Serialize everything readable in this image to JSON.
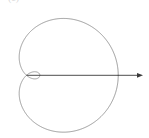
{
  "figure": {
    "panel_label": "(c)",
    "background_color": "#ffffff",
    "curve_color": "#8f8f8f",
    "axis_color": "#3a3a3a",
    "curve_stroke_width": 0.9,
    "axis_stroke_width": 0.9,
    "width": 149,
    "height": 138
  },
  "chart_data": {
    "type": "line",
    "title": "",
    "subtitle": "",
    "xlabel": "",
    "ylabel": "",
    "legend": [],
    "grid": false,
    "axes": {
      "polar_origin": [
        26.5,
        75.3
      ],
      "horizontal_axis": {
        "label": "",
        "x_start": 26.5,
        "x_end": 143.0,
        "y": 75.3,
        "arrowhead": "right",
        "arrow_tip": [
          143.0,
          75.3
        ]
      }
    },
    "curve": {
      "name": "limacon-with-inner-loop",
      "polar_equation": "r = a + b*cos(theta)",
      "a": 1.0,
      "b": 1.34,
      "theta_range_deg": [
        0,
        360
      ],
      "samples": 721,
      "center_px": [
        26.5,
        75.3
      ],
      "scale_px_per_unit": 39.2,
      "extents_px": {
        "x_min": 10.5,
        "x_max": 118.0,
        "y_min": 12.5,
        "y_max": 131.5
      },
      "inner_loop_px": {
        "x_min": 21.0,
        "x_max": 32.5,
        "y_min": 72.0,
        "y_max": 78.6
      },
      "self_intersection_px": [
        26.5,
        75.3
      ]
    }
  }
}
